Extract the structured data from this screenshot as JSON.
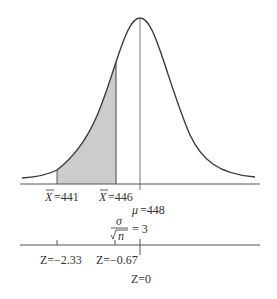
{
  "diagram": {
    "type": "normal-distribution-sampling",
    "colors": {
      "curve": "#3a3a3a",
      "shade": "#cccccc",
      "axis": "#555555",
      "text": "#333333"
    },
    "xbar_axis": {
      "labels": [
        {
          "symbol": "X",
          "text": "=441"
        },
        {
          "symbol": "X",
          "text": "=446"
        }
      ],
      "mean_label": {
        "symbol": "μ",
        "text": "=448"
      }
    },
    "standard_error": {
      "numerator": "σ",
      "denominator": "n",
      "equals": "= 3"
    },
    "z_axis": {
      "labels": [
        "Z=−2.33",
        "Z=−0.67",
        "Z=0"
      ]
    }
  }
}
